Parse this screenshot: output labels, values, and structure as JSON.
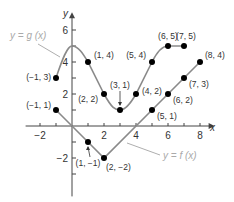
{
  "chart_data": {
    "type": "line",
    "title": "",
    "xlabel": "x",
    "ylabel": "y",
    "xlim": [
      -3,
      9
    ],
    "ylim": [
      -4,
      7
    ],
    "grid": false,
    "x_ticks": [
      -2,
      -1,
      0,
      1,
      2,
      3,
      4,
      5,
      6,
      7,
      8
    ],
    "y_ticks": [
      -3,
      -2,
      -1,
      0,
      1,
      2,
      3,
      4,
      5,
      6
    ],
    "x_tick_labels": [
      {
        "value": -2,
        "label": "−2"
      },
      {
        "value": 2,
        "label": "2"
      },
      {
        "value": 4,
        "label": "4"
      },
      {
        "value": 6,
        "label": "6"
      },
      {
        "value": 8,
        "label": "8"
      }
    ],
    "y_tick_labels": [
      {
        "value": -2,
        "label": "−2"
      },
      {
        "value": 2,
        "label": "2"
      },
      {
        "value": 4,
        "label": "4"
      },
      {
        "value": 6,
        "label": "6"
      }
    ],
    "series": [
      {
        "name": "y = g(x)",
        "label": "y = g (x)",
        "color": "#8a8a8a",
        "curve": "smooth",
        "points": [
          {
            "x": -1,
            "y": 3,
            "label": "(−1, 3)"
          },
          {
            "x": 1,
            "y": 4,
            "label": "(1, 4)"
          },
          {
            "x": 2,
            "y": 2,
            "label": "(2, 2)"
          },
          {
            "x": 3,
            "y": 1,
            "label": "(3, 1)"
          },
          {
            "x": 4,
            "y": 2,
            "label": "(4, 2)"
          },
          {
            "x": 5,
            "y": 4,
            "label": "(5, 4)"
          },
          {
            "x": 6,
            "y": 5,
            "label": "(6, 5)"
          },
          {
            "x": 7,
            "y": 5,
            "label": "(7, 5)"
          }
        ]
      },
      {
        "name": "y = f(x)",
        "label": "y = f (x)",
        "color": "#8a8a8a",
        "curve": "piecewise-linear",
        "points": [
          {
            "x": -1,
            "y": 1,
            "label": "(−1, 1)"
          },
          {
            "x": 1,
            "y": -1,
            "label": "(1, −1)"
          },
          {
            "x": 2,
            "y": -2,
            "label": "(2, −2)"
          },
          {
            "x": 5,
            "y": 1,
            "label": "(5, 1)"
          },
          {
            "x": 6,
            "y": 2,
            "label": "(6, 2)"
          },
          {
            "x": 7,
            "y": 3,
            "label": "(7, 3)"
          },
          {
            "x": 8,
            "y": 4,
            "label": "(8, 4)"
          }
        ]
      }
    ],
    "annotations": [
      {
        "text": "y = g (x)",
        "points_to": {
          "x": 0,
          "y": 4.7
        }
      },
      {
        "text": "y = f (x)",
        "points_to": {
          "x": 4.5,
          "y": 0.3
        }
      },
      {
        "text": "(3, 1)",
        "arrow_to": {
          "x": 3,
          "y": 1
        }
      },
      {
        "text": "(1, −1)",
        "arrow_to": {
          "x": 1,
          "y": -1
        }
      }
    ]
  },
  "labels": {
    "x_axis": "x",
    "y_axis": "y",
    "g_label": "y = g (x)",
    "f_label": "y = f (x)"
  },
  "colors": {
    "curve": "#8a8a8a",
    "axis": "#444444",
    "point": "#000000",
    "fn_label": "#aaaaaa"
  }
}
